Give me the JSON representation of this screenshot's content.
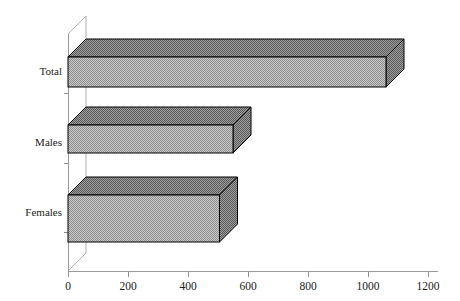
{
  "chart_data": {
    "type": "bar",
    "orientation": "horizontal",
    "style": "3d",
    "title": "",
    "subtitle": "",
    "xlabel": "",
    "ylabel": "",
    "categories": [
      "Total",
      "Males",
      "Females"
    ],
    "values": [
      1060,
      550,
      505
    ],
    "series": [
      {
        "name": "",
        "values": [
          1060,
          550,
          505
        ]
      }
    ],
    "xlim": [
      0,
      1200
    ],
    "xticks": [
      0,
      200,
      400,
      600,
      800,
      1000,
      1200
    ],
    "xtick_labels": [
      "0",
      "200",
      "400",
      "600",
      "800",
      "1000",
      "1200"
    ],
    "ytick_labels": [
      "Total",
      "Males",
      "Females"
    ],
    "grid": false,
    "legend": false,
    "legend_position": "none",
    "annotations": []
  },
  "axis": {
    "tick_0": "0",
    "tick_200": "200",
    "tick_400": "400",
    "tick_600": "600",
    "tick_800": "800",
    "tick_1000": "1000",
    "tick_1200": "1200"
  },
  "labels": {
    "total": "Total",
    "males": "Males",
    "females": "Females"
  },
  "colors": {
    "background": "#ffffff",
    "bar_front": "#a8a8a8",
    "bar_top": "#787878",
    "bar_side": "#787878",
    "outline": "#000000",
    "axis": "#9a9a9a",
    "text": "#1a1a1a"
  }
}
